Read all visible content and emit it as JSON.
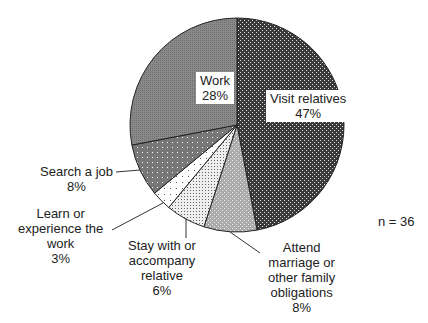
{
  "chart_data": {
    "type": "pie",
    "title": "",
    "annotation": "n = 36",
    "categories": [
      "Visit relatives",
      "Attend marriage or other family obligations",
      "Stay with or accompany relative",
      "Learn or experience the work",
      "Search a job",
      "Work"
    ],
    "values": [
      47,
      8,
      6,
      3,
      8,
      28
    ],
    "unit": "%",
    "start_angle": "12 o'clock, clockwise"
  },
  "labels": {
    "visit": {
      "line1": "Visit  relatives",
      "line2": "47%"
    },
    "work": {
      "line1": "Work",
      "line2": "28%"
    },
    "search": {
      "line1": "Search a job",
      "line2": "8%"
    },
    "learn": {
      "line1": "Learn or",
      "line2": "experience the",
      "line3": "work",
      "line4": "3%"
    },
    "stay": {
      "line1": "Stay with or",
      "line2": "accompany",
      "line3": "relative",
      "line4": "6%"
    },
    "attend": {
      "line1": "Attend",
      "line2": "marriage or",
      "line3": "other  family",
      "line4": "obligations",
      "line5": "8%"
    }
  },
  "n_label": "n = 36"
}
